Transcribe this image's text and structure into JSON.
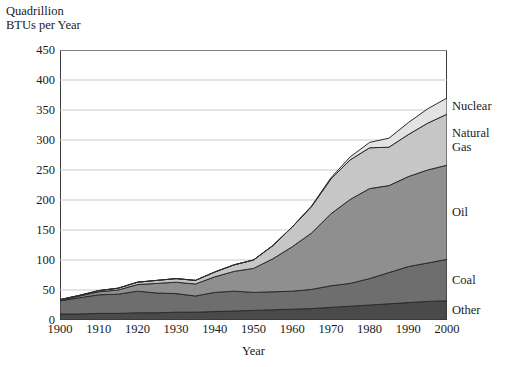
{
  "axis": {
    "y_title": "Quadrillion\nBTUs per Year",
    "x_title": "Year"
  },
  "chart_data": {
    "type": "area",
    "title": "",
    "subtitle": "",
    "xlabel": "Year",
    "ylabel": "Quadrillion BTUs per Year",
    "stacked": true,
    "grid": true,
    "legend_position": "right-inline",
    "xlim": [
      1900,
      2000
    ],
    "ylim": [
      0,
      450
    ],
    "ytick_values": [
      0,
      50,
      100,
      150,
      200,
      250,
      300,
      350,
      400,
      450
    ],
    "ytick_labels": [
      "0",
      "50",
      "100",
      "150",
      "200",
      "250",
      "300",
      "350",
      "400",
      "450"
    ],
    "xtick_values": [
      1900,
      1910,
      1920,
      1930,
      1940,
      1950,
      1960,
      1970,
      1980,
      1990,
      2000
    ],
    "xtick_labels": [
      "1900",
      "1910",
      "1920",
      "1930",
      "1940",
      "1950",
      "1960",
      "1970",
      "1980",
      "1990",
      "2000"
    ],
    "x": [
      1900,
      1905,
      1910,
      1915,
      1920,
      1925,
      1930,
      1935,
      1940,
      1945,
      1950,
      1955,
      1960,
      1965,
      1970,
      1975,
      1980,
      1985,
      1990,
      1995,
      2000
    ],
    "series": [
      {
        "name": "Other",
        "color": "#4a4a4a",
        "values": [
          10,
          10,
          11,
          11,
          12,
          12,
          13,
          13,
          14,
          15,
          16,
          17,
          18,
          19,
          21,
          23,
          25,
          27,
          29,
          31,
          32
        ]
      },
      {
        "name": "Coal",
        "color": "#6e6e6e",
        "values": [
          22,
          27,
          31,
          32,
          36,
          33,
          31,
          27,
          32,
          33,
          30,
          30,
          30,
          32,
          36,
          38,
          44,
          52,
          60,
          64,
          69
        ]
      },
      {
        "name": "Oil",
        "color": "#8f8f8f",
        "values": [
          1,
          3,
          5,
          7,
          11,
          16,
          19,
          20,
          26,
          33,
          40,
          55,
          74,
          94,
          120,
          140,
          150,
          145,
          150,
          155,
          157
        ]
      },
      {
        "name": "Natural Gas",
        "color": "#c6c6c6",
        "values": [
          1,
          1,
          2,
          3,
          4,
          5,
          6,
          6,
          8,
          11,
          14,
          22,
          33,
          44,
          58,
          66,
          68,
          64,
          70,
          78,
          85
        ]
      },
      {
        "name": "Nuclear",
        "color": "#e3e3e3",
        "values": [
          0,
          0,
          0,
          0,
          0,
          0,
          0,
          0,
          0,
          0,
          0,
          0,
          0,
          1,
          2,
          5,
          9,
          15,
          20,
          24,
          27
        ]
      }
    ],
    "totals": [
      34,
      41,
      49,
      53,
      63,
      66,
      69,
      66,
      80,
      92,
      100,
      124,
      155,
      190,
      237,
      272,
      296,
      303,
      329,
      352,
      370
    ],
    "annotations": [
      {
        "text": "Nuclear",
        "value_2000": 27
      },
      {
        "text": "Natural\nGas",
        "value_2000": 85
      },
      {
        "text": "Oil",
        "value_2000": 157
      },
      {
        "text": "Coal",
        "value_2000": 69
      },
      {
        "text": "Other",
        "value_2000": 32
      }
    ]
  }
}
